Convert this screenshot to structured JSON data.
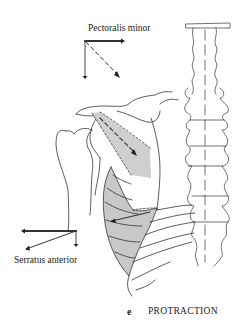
{
  "figure": {
    "panel_letter": "e",
    "title": "PROTRACTION",
    "labels": {
      "pectoralis_minor": "Pectoralis minor",
      "serratus_anterior": "Serratus anterior"
    },
    "colors": {
      "line": "#333333",
      "muscle_fill": "#c8c8c8",
      "background": "#ffffff"
    }
  }
}
